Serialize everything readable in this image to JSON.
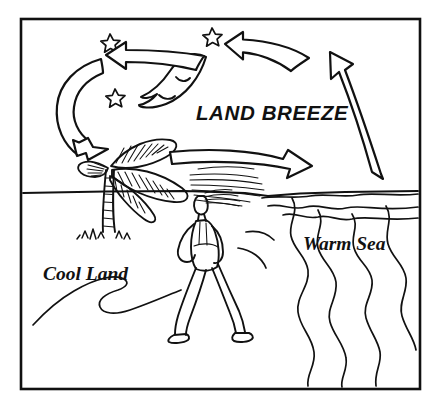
{
  "diagram": {
    "title": "Land Breeze",
    "type": "hand-drawn educational weather diagram",
    "background_color": "#ffffff",
    "ink_color": "#111111",
    "frame": {
      "name": "border-frame",
      "x": 21,
      "y": 19,
      "width": 399,
      "height": 370
    },
    "labels": {
      "headline": "LAND BREEZE",
      "land": "Cool Land",
      "sea": "Warm Sea"
    },
    "scene": {
      "time_of_day": "night",
      "horizon_y": 192,
      "celestial": {
        "moon": "crescent-moon-sleeping-face",
        "star_count": 3
      },
      "elements": [
        "crescent-moon",
        "stars",
        "palm-tree",
        "walking-person",
        "beach-path",
        "sea-waves"
      ]
    },
    "airflow": {
      "description": "Nighttime circulation cell: air rises over the warm sea, flows landward aloft, sinks over the cool land, and returns seaward at the surface as the land breeze.",
      "arrows": [
        {
          "name": "rising-arrow-over-sea",
          "label": "rising air over warm sea",
          "direction": "up-left",
          "location": "right side, over sea"
        },
        {
          "name": "aloft-arrow-right",
          "label": "upper-level flow toward land",
          "direction": "left",
          "location": "upper right sky"
        },
        {
          "name": "aloft-arrow-left",
          "label": "upper-level flow toward land",
          "direction": "left",
          "location": "upper left sky"
        },
        {
          "name": "sinking-arrow-over-land",
          "label": "sinking air over cool land",
          "direction": "down-right",
          "location": "left side, over land"
        },
        {
          "name": "surface-arrow-land-breeze",
          "label": "surface land breeze blowing out to sea",
          "direction": "right",
          "location": "treetop level, land to sea"
        }
      ]
    }
  }
}
